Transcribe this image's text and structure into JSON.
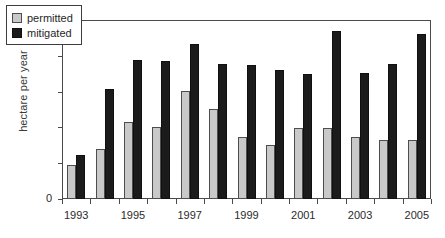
{
  "chart_data": {
    "type": "bar",
    "title": "",
    "subtitle": "",
    "xlabel": "",
    "ylabel": "hectare per year",
    "ylim": [
      0,
      25000
    ],
    "ytick_values": [
      0,
      5000,
      10000,
      15000,
      20000,
      25000
    ],
    "ytick_labels": [
      "0",
      "5,000",
      "10,000",
      "15,000",
      "20,000",
      "25,000"
    ],
    "grid": true,
    "grid_axis": "y",
    "legend_position": "upper left inside",
    "categories": [
      "1993",
      "1994",
      "1995",
      "1996",
      "1997",
      "1998",
      "1999",
      "2000",
      "2001",
      "2002",
      "2003",
      "2004",
      "2005"
    ],
    "xtick_labels_shown": [
      "1993",
      "1995",
      "1997",
      "1999",
      "2001",
      "2003",
      "2005"
    ],
    "series": [
      {
        "name": "permitted",
        "color": "#c9c9c9",
        "values": [
          4800,
          7000,
          10700,
          10100,
          15100,
          12600,
          8700,
          7500,
          9900,
          9900,
          8600,
          8300,
          8300
        ]
      },
      {
        "name": "mitigated",
        "color": "#1b1b1b",
        "values": [
          6200,
          15400,
          19400,
          19300,
          21600,
          18800,
          18700,
          18000,
          17400,
          23400,
          17600,
          18800,
          23000
        ]
      }
    ]
  },
  "legend": {
    "items": [
      {
        "label": "permitted",
        "swatch": "permitted-swatch"
      },
      {
        "label": "mitigated",
        "swatch": "mitigated-swatch"
      }
    ]
  },
  "axes": {
    "y_title": "hectare per year",
    "zero_label": "0"
  }
}
